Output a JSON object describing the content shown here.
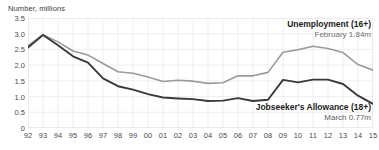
{
  "chart_data": {
    "type": "line",
    "title": "",
    "ylabel": "Number, millions",
    "xlabel": "",
    "ylim": [
      0,
      3.5
    ],
    "yticks": [
      "0",
      "0.5",
      "1.0",
      "1.5",
      "2.0",
      "2.5",
      "3.0",
      "3.5"
    ],
    "ytick_values": [
      0,
      0.5,
      1.0,
      1.5,
      2.0,
      2.5,
      3.0,
      3.5
    ],
    "grid": true,
    "legend_position": "inline-annotations",
    "x": [
      "92",
      "93",
      "94",
      "95",
      "96",
      "97",
      "98",
      "99",
      "00",
      "01",
      "02",
      "03",
      "04",
      "05",
      "06",
      "07",
      "08",
      "09",
      "10",
      "11",
      "12",
      "13",
      "14",
      "15"
    ],
    "xtick_labels": [
      "92",
      "93",
      "94",
      "95",
      "96",
      "97",
      "98",
      "99",
      "00",
      "01",
      "02",
      "03",
      "04",
      "05",
      "06",
      "07",
      "08",
      "09",
      "10",
      "11",
      "12",
      "13",
      "14",
      "15"
    ],
    "series": [
      {
        "name": "Unemployment (16+)",
        "color": "#9a9a9a",
        "annotation_value": "February 1.84m",
        "values": [
          2.62,
          2.97,
          2.74,
          2.45,
          2.32,
          2.05,
          1.79,
          1.74,
          1.62,
          1.48,
          1.52,
          1.49,
          1.42,
          1.44,
          1.66,
          1.66,
          1.77,
          2.41,
          2.49,
          2.6,
          2.53,
          2.4,
          2.02,
          1.84
        ]
      },
      {
        "name": "Jobseeker's Allowance (18+)",
        "color": "#3a3a3a",
        "annotation_value": "March 0.77m",
        "values": [
          2.56,
          2.96,
          2.63,
          2.28,
          2.08,
          1.58,
          1.33,
          1.22,
          1.08,
          0.97,
          0.94,
          0.92,
          0.86,
          0.87,
          0.95,
          0.86,
          0.9,
          1.53,
          1.45,
          1.54,
          1.54,
          1.4,
          1.03,
          0.77
        ]
      }
    ]
  },
  "annotations": {
    "unemployment": {
      "title": "Unemployment (16+)",
      "value": "February 1.84m"
    },
    "jsa": {
      "title": "Jobseeker's Allowance (18+)",
      "value": "March 0.77m"
    }
  },
  "axis": {
    "y_title": "Number, millions"
  },
  "colors": {
    "unemployment_line": "#9a9a9a",
    "jsa_line": "#3a3a3a",
    "grid": "#e4e4e4",
    "text": "#4a4a4a",
    "background": "#ffffff"
  }
}
